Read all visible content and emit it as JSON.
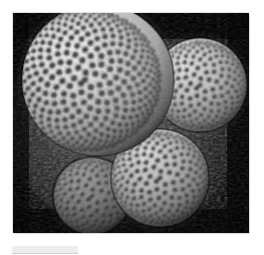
{
  "page": {
    "background_color": "#ffffff",
    "width": 264,
    "height": 255
  },
  "photo": {
    "alt_text": "Cluster of four pincushion cacti photographed in black and white",
    "subject": "Mammillaria cactus cluster",
    "color_mode": "grayscale",
    "background_color": "#000000",
    "border_color": "#e2e2e2",
    "frame": {
      "x": 13,
      "y": 13,
      "width": 236,
      "height": 220
    },
    "lighting": "strong directional light from upper-left, deep shadow lower-left and right",
    "subjects": [
      {
        "name": "large-cactus-upper-left",
        "label": "Large cactus",
        "center_x": 85,
        "center_y": 80,
        "radius": 78,
        "brightness": "bright",
        "spiral_arms": 21,
        "counter_arms": 13,
        "tubercle_rows": 17,
        "highlight_color": "#e8e8e8",
        "shadow_color": "#202020"
      },
      {
        "name": "medium-cactus-right",
        "label": "Right cactus",
        "center_x": 200,
        "center_y": 85,
        "radius": 48,
        "brightness": "bright",
        "spiral_arms": 15,
        "counter_arms": 10,
        "tubercle_rows": 12,
        "highlight_color": "#dcdcdc",
        "shadow_color": "#1a1a1a"
      },
      {
        "name": "medium-cactus-bottom-center",
        "label": "Lower cactus",
        "center_x": 160,
        "center_y": 178,
        "radius": 50,
        "brightness": "medium-bright",
        "spiral_arms": 15,
        "counter_arms": 10,
        "tubercle_rows": 12,
        "highlight_color": "#d2d2d2",
        "shadow_color": "#141414"
      },
      {
        "name": "small-cactus-bottom-left",
        "label": "Shadowed cactus",
        "center_x": 92,
        "center_y": 196,
        "radius": 40,
        "brightness": "dim",
        "spiral_arms": 13,
        "counter_arms": 8,
        "tubercle_rows": 10,
        "highlight_color": "#8c8c8c",
        "shadow_color": "#0a0a0a"
      }
    ],
    "ground_texture": {
      "name": "spine-litter-background",
      "color": "#3a3a3a",
      "description": "dark mottled spiny texture surrounding the cacti"
    }
  },
  "caption_bar": {
    "label": "",
    "color": "#ededed",
    "rule_color": "#cfcfcf"
  }
}
